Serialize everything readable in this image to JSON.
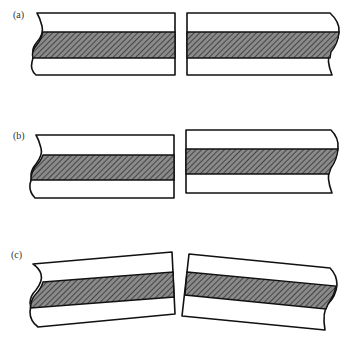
{
  "figure": {
    "colors": {
      "outline": "#111111",
      "fill": "#ffffff",
      "hatch_background": "#8a8a8a",
      "hatch_lines": "#333333"
    },
    "panels": [
      {
        "id": "a",
        "label": "(a)",
        "case": "aligned pieces"
      },
      {
        "id": "b",
        "label": "(b)",
        "case": "vertically offset pieces"
      },
      {
        "id": "c",
        "label": "(c)",
        "case": "angled (tilted) pieces"
      }
    ]
  }
}
